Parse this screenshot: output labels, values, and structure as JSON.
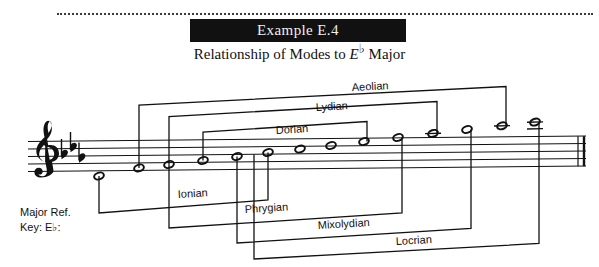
{
  "header": {
    "example_label": "Example E.4",
    "subtitle_pre": "Relationship of Modes to ",
    "subtitle_note": "E",
    "subtitle_flat": "♭",
    "subtitle_post": " Major"
  },
  "reference": {
    "line1": "Major Ref.",
    "line2": "Key: E♭:"
  },
  "notation": {
    "clef": "treble-clef",
    "key_signature": "3 flats",
    "key_signature_glyph": "♭",
    "note_head_type": "half-note",
    "bar_end": "double-barline",
    "note_count": 13
  },
  "modes": [
    {
      "label": "Aeolian",
      "name": "aeolian"
    },
    {
      "label": "Lydian",
      "name": "lydian"
    },
    {
      "label": "Dorian",
      "name": "dorian"
    },
    {
      "label": "Ionian",
      "name": "ionian"
    },
    {
      "label": "Phrygian",
      "name": "phrygian"
    },
    {
      "label": "Mixolydian",
      "name": "mixolydian"
    },
    {
      "label": "Locrian",
      "name": "locrian"
    }
  ],
  "colors": {
    "ink": "#111111",
    "title_bar": "#111111",
    "title_text": "#f2f0ec",
    "paper": "#ffffff"
  }
}
